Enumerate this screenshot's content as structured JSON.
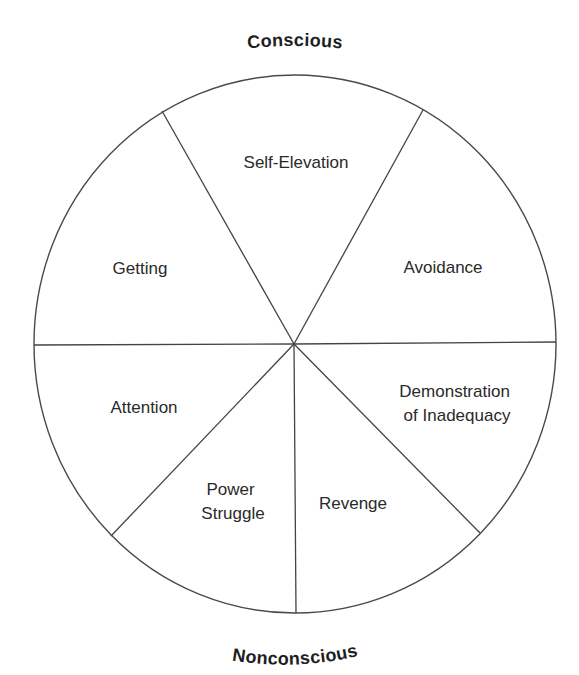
{
  "diagram": {
    "type": "segmented-circle",
    "top_label": "Conscious",
    "bottom_label": "Nonconscious",
    "segments": [
      {
        "label_lines": [
          "Self-Elevation"
        ],
        "position": "top"
      },
      {
        "label_lines": [
          "Avoidance"
        ],
        "position": "upper-right"
      },
      {
        "label_lines": [
          "Demonstration",
          "of Inadequacy"
        ],
        "position": "lower-right"
      },
      {
        "label_lines": [
          "Revenge"
        ],
        "position": "bottom-right"
      },
      {
        "label_lines": [
          "Power",
          "Struggle"
        ],
        "position": "bottom-left"
      },
      {
        "label_lines": [
          "Attention"
        ],
        "position": "lower-left"
      },
      {
        "label_lines": [
          "Getting"
        ],
        "position": "upper-left"
      }
    ],
    "colors": {
      "line": "#444444",
      "text": "#2a2a2a",
      "background": "#ffffff"
    }
  }
}
